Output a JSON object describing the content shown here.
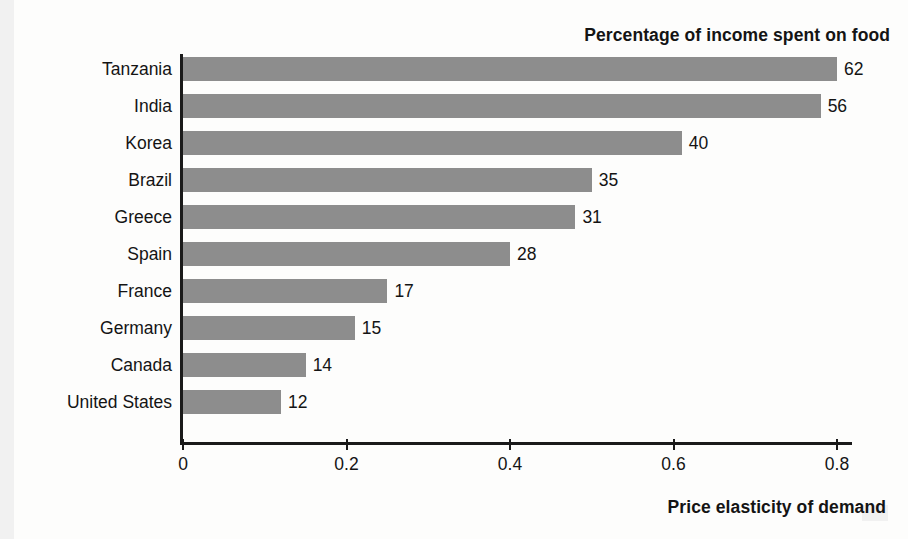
{
  "chart_data": {
    "type": "bar",
    "orientation": "horizontal",
    "title": "Percentage of income spent on food",
    "xlabel": "Price elasticity of demand",
    "ylabel": "",
    "grid": false,
    "legend": "none",
    "xlim": [
      0,
      0.8
    ],
    "xticks": [
      "0",
      "0.2",
      "0.4",
      "0.6",
      "0.8"
    ],
    "xtick_values": [
      0,
      0.2,
      0.4,
      0.6,
      0.8
    ],
    "categories": [
      "Tanzania",
      "India",
      "Korea",
      "Brazil",
      "Greece",
      "Spain",
      "France",
      "Germany",
      "Canada",
      "United States"
    ],
    "values": [
      0.8,
      0.78,
      0.61,
      0.5,
      0.48,
      0.4,
      0.25,
      0.21,
      0.15,
      0.12
    ],
    "data_labels": [
      "62",
      "56",
      "40",
      "35",
      "31",
      "28",
      "17",
      "15",
      "14",
      "12"
    ],
    "data_label_meaning": "Percentage of income spent on food",
    "bar_color": "#8d8d8d",
    "axis_color": "#1a1a1a",
    "text_color": "#141414",
    "background_color": "#fdfdfc"
  },
  "top_title": "Percentage of income spent on food",
  "bottom_title": "Price elasticity of demand"
}
